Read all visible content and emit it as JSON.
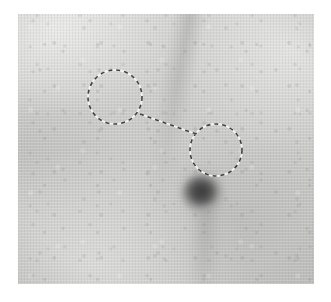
{
  "figure": {
    "canvas": {
      "width": 331,
      "height": 302
    },
    "background_color": "#ffffff"
  },
  "plate": {
    "name": "image-plate",
    "x": 18,
    "y": 14,
    "width": 296,
    "height": 270,
    "base_color": "#cbccca",
    "light_tone": "#d4d5d3",
    "dark_tone": "#bfc0be"
  },
  "annotations": {
    "stroke_dark": "#3f4240",
    "stroke_light": "#f4f5f3",
    "stroke_width": 1.6,
    "dash_pattern": "4 4",
    "circles": [
      {
        "label": "left-annotation-circle",
        "cx": 97,
        "cy": 83,
        "r": 27
      },
      {
        "label": "right-annotation-circle",
        "cx": 198,
        "cy": 136,
        "r": 26
      }
    ],
    "connector": {
      "label": "dashed-connector-line",
      "x1": 122,
      "y1": 100,
      "x2": 178,
      "y2": 120
    }
  },
  "blob": {
    "label": "dark-blob",
    "cx": 185,
    "cy": 180,
    "rx": 22,
    "ry": 20,
    "core_color": "#3b3c3b",
    "edge_color": "#a6a7a5"
  }
}
